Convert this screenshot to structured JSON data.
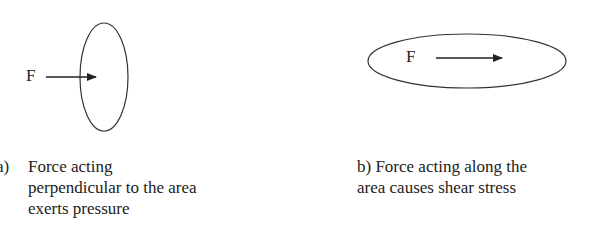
{
  "figure_a": {
    "force_label": "F",
    "caption_label": "a)",
    "caption_lines": [
      "Force acting",
      "perpendicular to the area",
      "exerts pressure"
    ]
  },
  "figure_b": {
    "force_label": "F",
    "caption_lines": [
      "b) Force acting along the",
      "area causes shear stress"
    ]
  },
  "colors": {
    "stroke": "#333333",
    "text": "#222222",
    "background": "#ffffff"
  }
}
